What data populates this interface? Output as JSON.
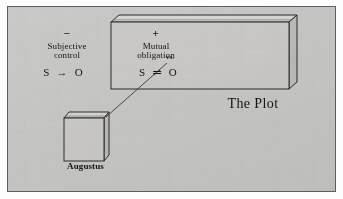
{
  "figure": {
    "title_caption": "The Plot",
    "node_caption": "Augustus",
    "background_color": "#c9c9c7",
    "ink_color": "#141414",
    "frame_color": "#5e5e5e"
  },
  "plot_box": {
    "connector_label": "vs.",
    "columns": [
      {
        "sign": "−",
        "heading_line1": "Subjective",
        "heading_line2": "control",
        "formula": "S → O"
      },
      {
        "sign": "+",
        "heading_line1": "Mutual",
        "heading_line2": "obligation",
        "formula": "S ⇌ O"
      }
    ]
  },
  "augustus_box": {
    "label": "Augustus"
  }
}
